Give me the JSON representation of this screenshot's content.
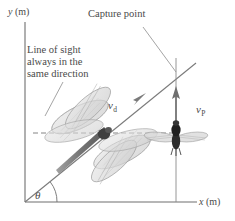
{
  "figure": {
    "kind": "physics-diagram",
    "background_color": "#ffffff",
    "ink_color": "#4a4a4a"
  },
  "axes": {
    "y_label": "y (m)",
    "y_label_symbol": "y",
    "y_label_unit": "(m)",
    "x_label": "x (m)",
    "x_label_symbol": "x",
    "x_label_unit": "(m)",
    "origin": {
      "x": 25,
      "y": 202
    },
    "x_axis_end": {
      "x": 197,
      "y": 202
    },
    "y_axis_top": {
      "x": 25,
      "y": 22
    },
    "color": "#6f6f6f"
  },
  "annotations": {
    "capture_point": "Capture point",
    "line_of_sight": {
      "line1": "Line of sight",
      "line2": "always in the",
      "line3": "same direction"
    },
    "angle_symbol": "θ"
  },
  "vectors": {
    "dragonfly_velocity": {
      "symbol": "v",
      "subscript": "d",
      "description": "dragonfly velocity along line of sight"
    },
    "prey_velocity": {
      "symbol": "v",
      "subscript": "P",
      "description": "prey velocity, straight up"
    }
  },
  "objects": {
    "dragonfly": {
      "name": "dragonfly",
      "center": {
        "x": 104,
        "y": 134
      },
      "body_color": "#5a5a5a",
      "wing_color": "#d8d8d8"
    },
    "prey": {
      "name": "prey-fly",
      "center": {
        "x": 176,
        "y": 133
      },
      "body_color": "#2e2e2e",
      "wing_color": "#cfcfcf"
    },
    "capture_point_marker": {
      "x": 176,
      "y": 73
    }
  },
  "geometry": {
    "sight_line_angle_deg": 39,
    "dashed_line": {
      "x1": 33,
      "x2": 176,
      "y": 133
    },
    "prey_path_x": 176
  }
}
